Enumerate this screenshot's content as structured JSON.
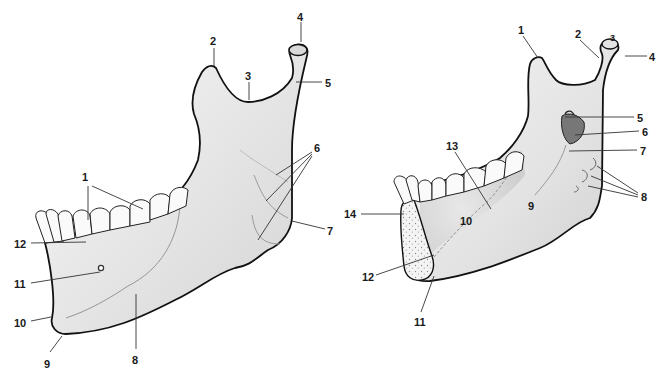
{
  "figure": {
    "type": "anatomical-diagram",
    "views": [
      {
        "id": "lateral",
        "labels": [
          {
            "n": "1",
            "x": 82,
            "y": 172
          },
          {
            "n": "2",
            "x": 210,
            "y": 36
          },
          {
            "n": "3",
            "x": 245,
            "y": 71
          },
          {
            "n": "4",
            "x": 297,
            "y": 12
          },
          {
            "n": "5",
            "x": 325,
            "y": 78
          },
          {
            "n": "6",
            "x": 314,
            "y": 143
          },
          {
            "n": "7",
            "x": 327,
            "y": 226
          },
          {
            "n": "8",
            "x": 132,
            "y": 355
          },
          {
            "n": "9",
            "x": 44,
            "y": 359
          },
          {
            "n": "10",
            "x": 14,
            "y": 318
          },
          {
            "n": "11",
            "x": 14,
            "y": 279
          },
          {
            "n": "12",
            "x": 14,
            "y": 239
          }
        ]
      },
      {
        "id": "medial",
        "labels": [
          {
            "n": "1",
            "x": 518,
            "y": 25
          },
          {
            "n": "2",
            "x": 575,
            "y": 29
          },
          {
            "n": "3",
            "x": 610,
            "y": 33
          },
          {
            "n": "4",
            "x": 649,
            "y": 52
          },
          {
            "n": "5",
            "x": 637,
            "y": 113
          },
          {
            "n": "6",
            "x": 642,
            "y": 127
          },
          {
            "n": "7",
            "x": 640,
            "y": 146
          },
          {
            "n": "8",
            "x": 641,
            "y": 192
          },
          {
            "n": "9",
            "x": 528,
            "y": 201
          },
          {
            "n": "10",
            "x": 460,
            "y": 216
          },
          {
            "n": "11",
            "x": 414,
            "y": 317
          },
          {
            "n": "12",
            "x": 362,
            "y": 272
          },
          {
            "n": "13",
            "x": 446,
            "y": 141
          },
          {
            "n": "14",
            "x": 344,
            "y": 209
          }
        ]
      }
    ]
  },
  "colors": {
    "bone_fill": "#ececec",
    "bone_outline": "#111111",
    "leader": "#333333",
    "text": "#1a1a1a",
    "background": "#ffffff"
  }
}
